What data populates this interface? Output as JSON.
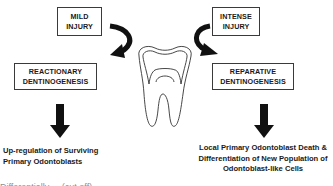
{
  "diagram": {
    "left": {
      "trigger_box": {
        "line1": "MILD",
        "line2": "INJURY"
      },
      "process_box": {
        "line1": "REACTIONARY",
        "line2": "DENTINOGENESIS"
      },
      "outcome": {
        "line1": "Up-regulation of Surviving",
        "line2": "Primary Odontoblasts"
      }
    },
    "right": {
      "trigger_box": {
        "line1": "INTENSE",
        "line2": "INJURY"
      },
      "process_box": {
        "line1": "REPARATIVE",
        "line2": "DENTINOGENESIS"
      },
      "outcome": {
        "line1": "Local Primary Odontoblast Death &",
        "line2": "Differentiation of New Population of",
        "line3": "Odontoblast-like Cells"
      }
    },
    "center_image": "tooth-outline",
    "caption_fragment": "Differentially ... (cut off)"
  },
  "colors": {
    "stroke": "#3a3a3a",
    "arrow": "#111111",
    "text": "#1a1a1a",
    "background": "#ffffff"
  }
}
